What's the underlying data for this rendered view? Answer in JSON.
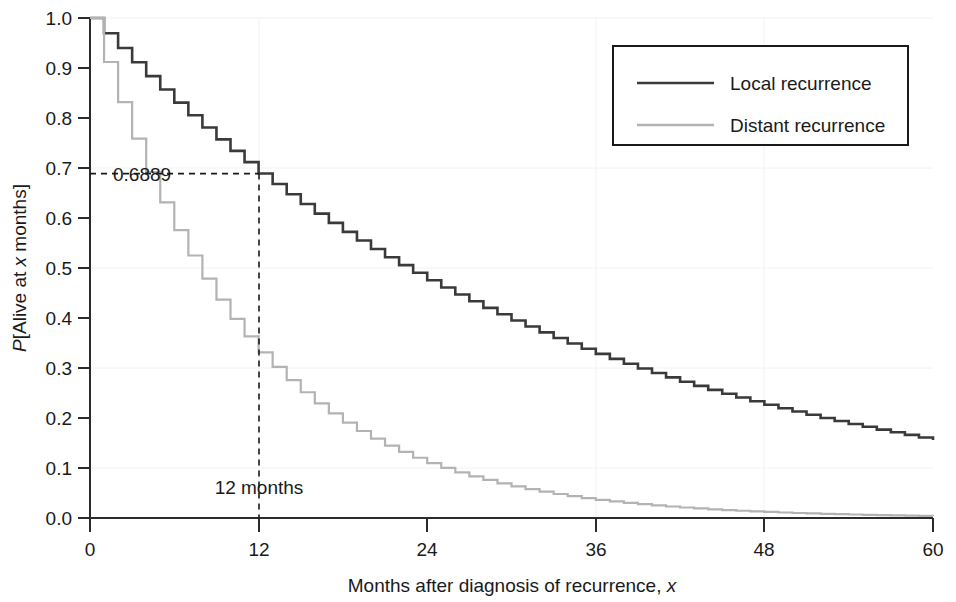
{
  "chart_data": {
    "type": "line",
    "title": "",
    "subtitle": "",
    "xlabel": "Months after diagnosis of recurrence, x",
    "ylabel": "P[Alive at x months]",
    "xlim": [
      0,
      60
    ],
    "ylim": [
      0,
      1.0
    ],
    "grid": false,
    "step_style": "post",
    "legend_position": "top-right",
    "xticks": [
      0,
      12,
      24,
      36,
      48,
      60
    ],
    "xtick_labels": [
      "0",
      "12",
      "24",
      "36",
      "48",
      "60"
    ],
    "yticks": [
      0.0,
      0.1,
      0.2,
      0.3,
      0.4,
      0.5,
      0.6,
      0.7,
      0.8,
      0.9,
      1.0
    ],
    "ytick_labels": [
      "0.0",
      "0.1",
      "0.2",
      "0.3",
      "0.4",
      "0.5",
      "0.6",
      "0.7",
      "0.8",
      "0.9",
      "1.0"
    ],
    "x": [
      0,
      1,
      2,
      3,
      4,
      5,
      6,
      7,
      8,
      9,
      10,
      11,
      12,
      13,
      14,
      15,
      16,
      17,
      18,
      19,
      20,
      21,
      22,
      23,
      24,
      25,
      26,
      27,
      28,
      29,
      30,
      31,
      32,
      33,
      34,
      35,
      36,
      37,
      38,
      39,
      40,
      41,
      42,
      43,
      44,
      45,
      46,
      47,
      48,
      49,
      50,
      51,
      52,
      53,
      54,
      55,
      56,
      57,
      58,
      59,
      60
    ],
    "series": [
      {
        "name": "Local recurrence",
        "color": "#3a3a3a",
        "style": "solid",
        "values": [
          1.0,
          0.9696,
          0.9401,
          0.9115,
          0.8838,
          0.8569,
          0.8308,
          0.8055,
          0.781,
          0.7572,
          0.7342,
          0.7118,
          0.6889,
          0.6679,
          0.6476,
          0.6279,
          0.6088,
          0.5903,
          0.5723,
          0.5549,
          0.538,
          0.5216,
          0.5058,
          0.4904,
          0.4755,
          0.461,
          0.447,
          0.4334,
          0.4202,
          0.4074,
          0.395,
          0.383,
          0.3713,
          0.36,
          0.3491,
          0.3385,
          0.3282,
          0.3182,
          0.3085,
          0.2991,
          0.29,
          0.2812,
          0.2726,
          0.2643,
          0.2563,
          0.2485,
          0.2409,
          0.2336,
          0.2265,
          0.2196,
          0.2129,
          0.2064,
          0.2001,
          0.194,
          0.1881,
          0.1824,
          0.1768,
          0.1714,
          0.1662,
          0.1611,
          0.1562
        ]
      },
      {
        "name": "Distant recurrence",
        "color": "#b3b3b3",
        "style": "solid",
        "values": [
          1.0,
          0.912,
          0.8318,
          0.7586,
          0.692,
          0.6311,
          0.5756,
          0.525,
          0.4788,
          0.4367,
          0.3983,
          0.3633,
          0.3313,
          0.3022,
          0.2757,
          0.2515,
          0.2294,
          0.2092,
          0.1908,
          0.174,
          0.1587,
          0.1448,
          0.1321,
          0.1205,
          0.1099,
          0.1002,
          0.0914,
          0.0834,
          0.0761,
          0.0694,
          0.0633,
          0.0577,
          0.0526,
          0.048,
          0.0438,
          0.0399,
          0.0364,
          0.0332,
          0.0303,
          0.0276,
          0.0252,
          0.023,
          0.021,
          0.0191,
          0.0174,
          0.0159,
          0.0145,
          0.0132,
          0.0121,
          0.011,
          0.01,
          0.0092,
          0.0084,
          0.0076,
          0.007,
          0.0063,
          0.0058,
          0.0053,
          0.0048,
          0.0044,
          0.004
        ]
      }
    ],
    "annotations": [
      {
        "name": "prob-annotation",
        "text": "0.6889",
        "x": 12,
        "y": 0.6889,
        "guide": "horizontal-dashed"
      },
      {
        "name": "months-annotation",
        "text": "12 months",
        "x": 12,
        "y": 0.1,
        "guide": "vertical-dashed"
      }
    ]
  },
  "legend": {
    "entries": [
      {
        "label": "Local recurrence",
        "color": "#3a3a3a"
      },
      {
        "label": "Distant recurrence",
        "color": "#b3b3b3"
      }
    ]
  },
  "axes": {
    "x_title_main": "Months after diagnosis of recurrence, ",
    "x_title_italic": "x",
    "y_title_italic_p": "P",
    "y_title_part1": "[Alive at ",
    "y_title_italic_x": "x",
    "y_title_part2": " months]"
  }
}
